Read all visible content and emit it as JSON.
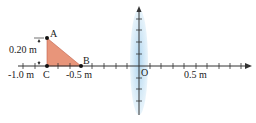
{
  "diagram": {
    "title": "",
    "axis": {
      "origin_label": "O",
      "tick_labels": [
        {
          "text": "-1.0 m",
          "pos": -1.0
        },
        {
          "text": "-0.5 m",
          "pos": -0.5
        },
        {
          "text": "0.5 m",
          "pos": 0.5
        }
      ]
    },
    "object": {
      "shape": "right triangle",
      "fill_color": "#e8957a",
      "points": {
        "A": {
          "label": "A"
        },
        "B": {
          "label": "B"
        },
        "C": {
          "label": "C"
        }
      },
      "height_label": "0.20 m"
    },
    "lens": {
      "type": "converging",
      "color": "#bcdcef"
    }
  }
}
